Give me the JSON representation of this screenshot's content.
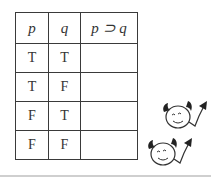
{
  "table": {
    "headers": [
      "p",
      "q",
      "p ⊃ q"
    ],
    "rows": [
      [
        "T",
        "T",
        ""
      ],
      [
        "T",
        "F",
        ""
      ],
      [
        "F",
        "T",
        ""
      ],
      [
        "F",
        "F",
        ""
      ]
    ]
  },
  "decorations": {
    "icons": [
      "devil-face-arrow-icon",
      "devil-face-arrow-icon"
    ]
  }
}
